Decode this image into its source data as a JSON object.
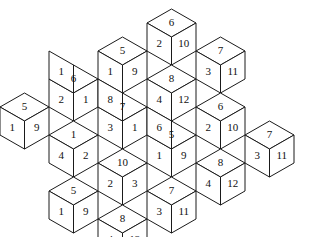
{
  "figure": {
    "type": "rhombille-tiling",
    "background_color": "#ffffff",
    "stroke_color": "#1a1a1a",
    "label_color": "#111111",
    "geometry": {
      "unit_half_width": 24.5,
      "unit_half_height": 14.0,
      "unit_vertical": 28.0,
      "origin_x": 12.5,
      "origin_y": 121.0
    },
    "face_keys": [
      "left",
      "top",
      "right"
    ],
    "cubes": [
      {
        "id": "cube-0",
        "cx": 24.5,
        "cy": 121.0,
        "left": "1",
        "top": "5",
        "right": "9"
      },
      {
        "id": "cube-1",
        "cx": 73.5,
        "cy": 93.0,
        "left": "2",
        "top": "6",
        "right": "1"
      },
      {
        "id": "cube-2",
        "cx": 73.5,
        "cy": 149.0,
        "left": "4",
        "top": "1",
        "right": "2"
      },
      {
        "id": "cube-3",
        "cx": 122.5,
        "cy": 65.0,
        "left": "1",
        "top": "5",
        "right": "9"
      },
      {
        "id": "cube-4",
        "cx": 122.5,
        "cy": 121.0,
        "left": "3",
        "top": "7",
        "right": "1"
      },
      {
        "id": "cube-5",
        "cx": 122.5,
        "cy": 177.0,
        "left": "2",
        "top": "10",
        "right": "3"
      },
      {
        "id": "cube-6",
        "cx": 73.5,
        "cy": 205.0,
        "left": "1",
        "top": "5",
        "right": "9"
      },
      {
        "id": "cube-7",
        "cx": 122.5,
        "cy": 233.0,
        "left": "4",
        "top": "8",
        "right": "12"
      },
      {
        "id": "cube-8",
        "cx": 171.5,
        "cy": 37.0,
        "left": "2",
        "top": "6",
        "right": "10"
      },
      {
        "id": "cube-9",
        "cx": 171.5,
        "cy": 93.0,
        "left": "4",
        "top": "8",
        "right": "12"
      },
      {
        "id": "cube-10",
        "cx": 171.5,
        "cy": 149.0,
        "left": "1",
        "top": "5",
        "right": "9"
      },
      {
        "id": "cube-11",
        "cx": 171.5,
        "cy": 205.0,
        "left": "3",
        "top": "7",
        "right": "11"
      },
      {
        "id": "cube-12",
        "cx": 220.5,
        "cy": 65.0,
        "left": "3",
        "top": "7",
        "right": "11"
      },
      {
        "id": "cube-13",
        "cx": 220.5,
        "cy": 121.0,
        "left": "2",
        "top": "6",
        "right": "10"
      },
      {
        "id": "cube-14",
        "cx": 220.5,
        "cy": 177.0,
        "left": "4",
        "top": "8",
        "right": "12"
      },
      {
        "id": "cube-15",
        "cx": 269.5,
        "cy": 149.0,
        "left": "3",
        "top": "7",
        "right": "11"
      }
    ],
    "extra_faces": [
      {
        "id": "face-a",
        "cx": 73.5,
        "cy": 65.0,
        "orient": "left",
        "label": "1"
      },
      {
        "id": "face-b",
        "cx": 122.5,
        "cy": 93.0,
        "orient": "left",
        "label": "8"
      },
      {
        "id": "face-c",
        "cx": 171.5,
        "cy": 121.0,
        "orient": "left",
        "label": "6"
      }
    ],
    "all_labels": [
      "1",
      "5",
      "9",
      "2",
      "6",
      "1",
      "4",
      "1",
      "2",
      "1",
      "5",
      "9",
      "3",
      "7",
      "1",
      "2",
      "10",
      "3",
      "1",
      "5",
      "9",
      "4",
      "8",
      "12",
      "2",
      "6",
      "10",
      "4",
      "8",
      "12",
      "1",
      "5",
      "9",
      "3",
      "7",
      "11",
      "3",
      "7",
      "11",
      "2",
      "6",
      "10",
      "4",
      "8",
      "12",
      "3",
      "7",
      "11",
      "1",
      "8",
      "6"
    ]
  }
}
